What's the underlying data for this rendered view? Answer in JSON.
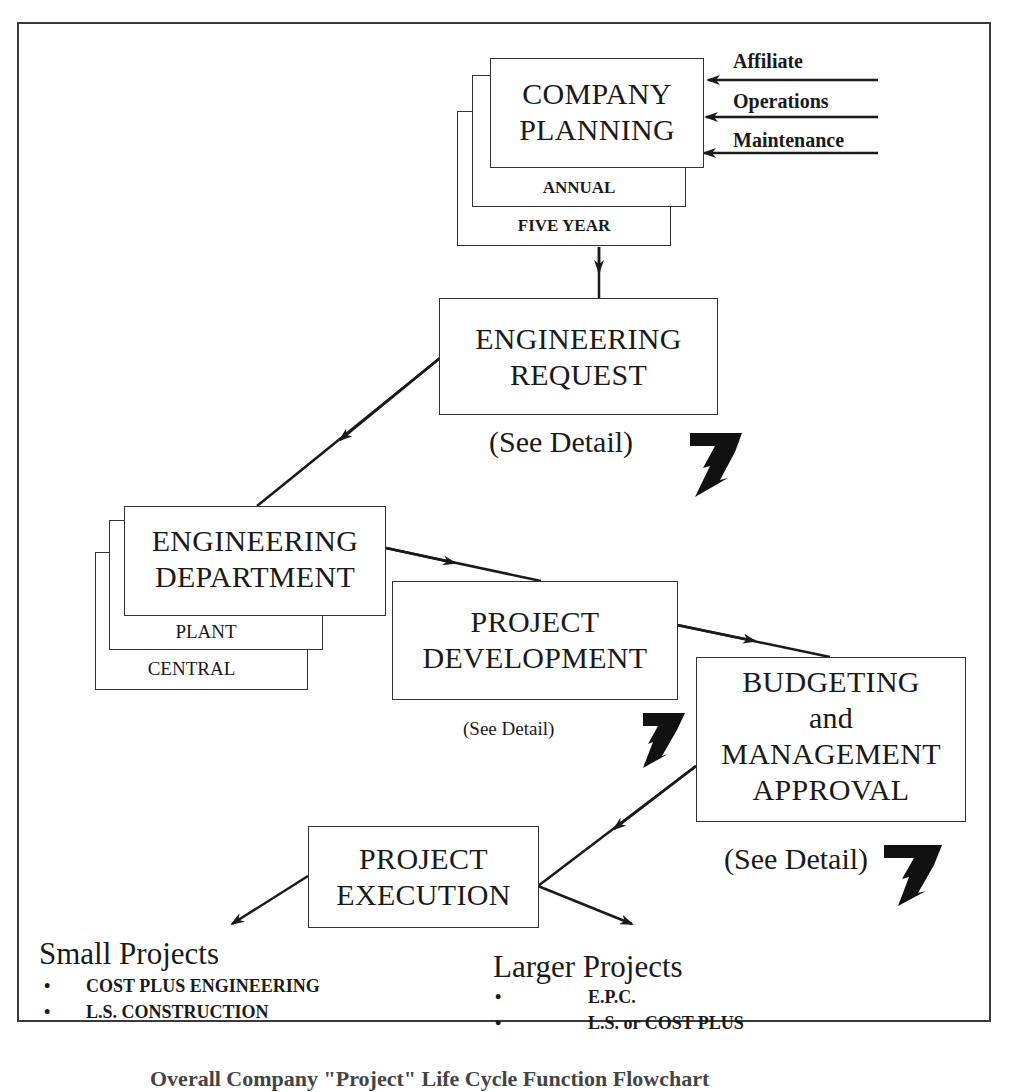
{
  "diagram": {
    "company_planning": {
      "title_line1": "COMPANY",
      "title_line2": "PLANNING",
      "layers": [
        "ANNUAL",
        "FIVE YEAR"
      ],
      "inputs": [
        "Affiliate",
        "Operations",
        "Maintenance"
      ]
    },
    "engineering_request": {
      "title_line1": "ENGINEERING",
      "title_line2": "REQUEST",
      "note": "(See Detail)"
    },
    "engineering_department": {
      "title_line1": "ENGINEERING",
      "title_line2": "DEPARTMENT",
      "layers": [
        "PLANT",
        "CENTRAL"
      ]
    },
    "project_development": {
      "title_line1": "PROJECT",
      "title_line2": "DEVELOPMENT",
      "note": "(See Detail)"
    },
    "budgeting": {
      "title_line1": "BUDGETING",
      "title_line2": "and",
      "title_line3": "MANAGEMENT",
      "title_line4": "APPROVAL",
      "note": "(See Detail)"
    },
    "project_execution": {
      "title_line1": "PROJECT",
      "title_line2": "EXECUTION"
    },
    "small_projects": {
      "heading": "Small Projects",
      "items": [
        "COST PLUS ENGINEERING",
        "L.S. CONSTRUCTION"
      ]
    },
    "larger_projects": {
      "heading": "Larger Projects",
      "items": [
        "E.P.C.",
        "L.S. or COST PLUS"
      ]
    },
    "bullet": "•",
    "caption": "Overall Company \"Project\" Life Cycle Function Flowchart"
  }
}
